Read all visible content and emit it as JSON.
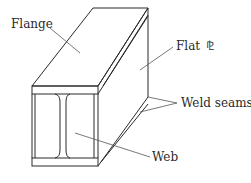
{
  "diagram": {
    "labels": {
      "flange": "Flange",
      "flat_plate": "Flat",
      "plate_symbol": "⅊",
      "weld_seams": "Weld seams",
      "web": "Web"
    },
    "colors": {
      "line": "#2a2a2a",
      "background": "#ffffff"
    }
  }
}
